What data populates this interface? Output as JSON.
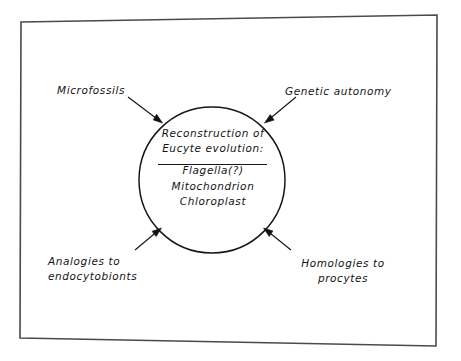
{
  "figure": {
    "title": "Reconstruction of Eucyte evolution",
    "background_color": "#ffffff",
    "ink_color": "#141414",
    "frame_color": "#4a4a4a"
  },
  "core": {
    "heading_line_1": "Reconstruction of",
    "heading_line_2": "Eucyte evolution:",
    "items": [
      "Flagella(?)",
      "Mitochondrion",
      "Chloroplast"
    ]
  },
  "evidence_labels": {
    "top_left": {
      "name": "microfossils",
      "line_1": "Microfossils"
    },
    "top_right": {
      "name": "genetic-autonomy",
      "line_1": "Genetic autonomy"
    },
    "bottom_left": {
      "name": "analogies-to-endocytobionts",
      "line_1": "Analogies to",
      "line_2": "endocytobionts"
    },
    "bottom_right": {
      "name": "homologies-to-procytes",
      "line_1": "Homologies to",
      "line_2": "procytes"
    }
  }
}
